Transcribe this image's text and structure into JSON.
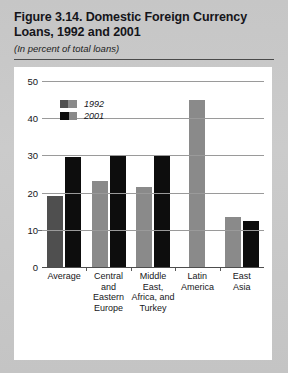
{
  "figure": {
    "title": "Figure 3.14. Domestic Foreign Currency Loans, 1992 and 2001",
    "subtitle": "(In percent of total loans)",
    "source": "Source: See Appendix."
  },
  "colors": {
    "series_1992": "#8a8a8a",
    "series_1992_average": "#4f4f4f",
    "series_2001": "#0d0d0d",
    "page_background": "#c9c9c9",
    "panel_background": "#ffffff",
    "gridline": "#9a9a9a"
  },
  "chart_data": {
    "type": "bar",
    "title": "Figure 3.14. Domestic Foreign Currency Loans, 1992 and 2001",
    "subtitle": "(In percent of total loans)",
    "xlabel": "",
    "ylabel": "",
    "ylim": [
      0,
      50
    ],
    "yticks": [
      0,
      10,
      20,
      30,
      40,
      50
    ],
    "ytick_labels": [
      "0",
      "10",
      "20",
      "30",
      "40",
      "50"
    ],
    "grid": true,
    "legend_position": "upper-left-inside",
    "categories": [
      "Average",
      "Central and Eastern Europe",
      "Middle East, Africa, and Turkey",
      "Latin America",
      "East Asia"
    ],
    "category_label_lines": [
      [
        "Average"
      ],
      [
        "Central",
        "and",
        "Eastern",
        "Europe"
      ],
      [
        "Middle",
        "East,",
        "Africa, and",
        "Turkey"
      ],
      [
        "Latin",
        "America"
      ],
      [
        "East",
        "Asia"
      ]
    ],
    "series": [
      {
        "name": "1992",
        "values": [
          19,
          23,
          21.5,
          45,
          13.5
        ]
      },
      {
        "name": "2001",
        "values": [
          29.5,
          30,
          30,
          null,
          12.5
        ]
      }
    ]
  },
  "legend": {
    "items": [
      {
        "label": "1992"
      },
      {
        "label": "2001"
      }
    ]
  }
}
